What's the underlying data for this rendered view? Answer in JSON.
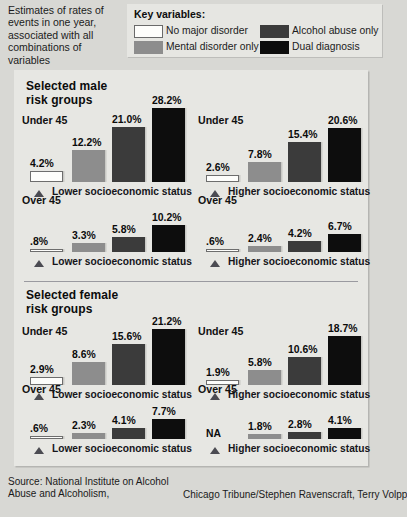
{
  "intro": {
    "text": "Estimates of rates of events in one year, associated with all combinations of variables"
  },
  "legend": {
    "title": "Key variables:",
    "items": [
      {
        "label": "No major disorder",
        "swatch": "white",
        "color": "#fdfdfb"
      },
      {
        "label": "Mental disorder only",
        "swatch": "gray",
        "color": "#8d8d8d"
      },
      {
        "label": "Alcohol abuse only",
        "swatch": "dark",
        "color": "#3b3b3b"
      },
      {
        "label": "Dual diagnosis",
        "swatch": "black",
        "color": "#0d0d0d"
      }
    ]
  },
  "sections": [
    {
      "title_line1": "Selected male",
      "title_line2": "risk groups"
    },
    {
      "title_line1": "Selected female",
      "title_line2": "risk groups"
    }
  ],
  "groups": [
    {
      "age": "Under 45",
      "axis": "Lower socioeconomic status",
      "values": [
        "4.2%",
        "12.2%",
        "21.0%",
        "28.2%"
      ]
    },
    {
      "age": "Under 45",
      "axis": "Higher socioeconomic status",
      "values": [
        "2.6%",
        "7.8%",
        "15.4%",
        "20.6%"
      ]
    },
    {
      "age": "Over 45",
      "axis": "Lower socioeconomic status",
      "values": [
        ".8%",
        "3.3%",
        "5.8%",
        "10.2%"
      ]
    },
    {
      "age": "Over 45",
      "axis": "Higher socioeconomic status",
      "values": [
        ".6%",
        "2.4%",
        "4.2%",
        "6.7%"
      ]
    },
    {
      "age": "Under 45",
      "axis": "Lower socioeconomic status",
      "values": [
        "2.9%",
        "8.6%",
        "15.6%",
        "21.2%"
      ]
    },
    {
      "age": "Under 45",
      "axis": "Higher socioeconomic status",
      "values": [
        "1.9%",
        "5.8%",
        "10.6%",
        "18.7%"
      ]
    },
    {
      "age": "Over 45",
      "axis": "Lower socioeconomic status",
      "values": [
        ".6%",
        "2.3%",
        "4.1%",
        "7.7%"
      ]
    },
    {
      "age": "Over 45",
      "axis": "Higher socioeconomic status",
      "values": [
        "NA",
        "1.8%",
        "2.8%",
        "4.1%"
      ]
    }
  ],
  "footer": {
    "source": "Source: National Institute on Alcohol Abuse and Alcoholism,",
    "credit": "Chicago Tribune/Stephen Ravenscraft, Terry Volpp"
  },
  "chart_data": {
    "type": "bar",
    "title": "Estimates of rates of events in one year, associated with all combinations of variables",
    "xlabel": "",
    "ylabel": "Rate of events in one year (%)",
    "ylim": [
      0,
      30
    ],
    "grid": false,
    "legend_position": "top",
    "series": [
      {
        "name": "No major disorder",
        "color": "#fdfdfb"
      },
      {
        "name": "Mental disorder only",
        "color": "#8d8d8d"
      },
      {
        "name": "Alcohol abuse only",
        "color": "#3b3b3b"
      },
      {
        "name": "Dual diagnosis",
        "color": "#0d0d0d"
      }
    ],
    "panels": [
      {
        "panel": "Selected male risk groups",
        "groups": [
          {
            "age": "Under 45",
            "ses": "Lower socioeconomic status",
            "values": [
              4.2,
              12.2,
              21.0,
              28.2
            ]
          },
          {
            "age": "Under 45",
            "ses": "Higher socioeconomic status",
            "values": [
              2.6,
              7.8,
              15.4,
              20.6
            ]
          },
          {
            "age": "Over 45",
            "ses": "Lower socioeconomic status",
            "values": [
              0.8,
              3.3,
              5.8,
              10.2
            ]
          },
          {
            "age": "Over 45",
            "ses": "Higher socioeconomic status",
            "values": [
              0.6,
              2.4,
              4.2,
              6.7
            ]
          }
        ]
      },
      {
        "panel": "Selected female risk groups",
        "groups": [
          {
            "age": "Under 45",
            "ses": "Lower socioeconomic status",
            "values": [
              2.9,
              8.6,
              15.6,
              21.2
            ]
          },
          {
            "age": "Under 45",
            "ses": "Higher socioeconomic status",
            "values": [
              1.9,
              5.8,
              10.6,
              18.7
            ]
          },
          {
            "age": "Over 45",
            "ses": "Lower socioeconomic status",
            "values": [
              0.6,
              2.3,
              4.1,
              7.7
            ]
          },
          {
            "age": "Over 45",
            "ses": "Higher socioeconomic status",
            "values": [
              null,
              1.8,
              2.8,
              4.1
            ]
          }
        ]
      }
    ],
    "source": "National Institute on Alcohol Abuse and Alcoholism",
    "credit": "Chicago Tribune/Stephen Ravenscraft, Terry Volpp"
  }
}
